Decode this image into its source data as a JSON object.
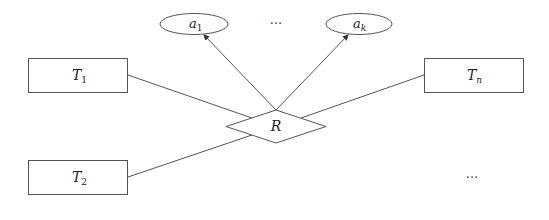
{
  "diagram": {
    "type": "er-diagram",
    "relationship": {
      "label": "R"
    },
    "entities": [
      {
        "id": "T1",
        "label": "T",
        "sub": "1"
      },
      {
        "id": "T2",
        "label": "T",
        "sub": "2"
      },
      {
        "id": "Tn",
        "label": "T",
        "sub": "n"
      }
    ],
    "attributes": [
      {
        "id": "a1",
        "label": "a",
        "sub": "1"
      },
      {
        "id": "ak",
        "label": "a",
        "sub": "k"
      }
    ],
    "ellipsis_attributes": "···",
    "ellipsis_entities": "···",
    "edges": [
      {
        "from": "T1",
        "to": "R",
        "arrow": false
      },
      {
        "from": "T2",
        "to": "R",
        "arrow": false
      },
      {
        "from": "Tn",
        "to": "R",
        "arrow": false
      },
      {
        "from": "R",
        "to": "a1",
        "arrow": true
      },
      {
        "from": "R",
        "to": "ak",
        "arrow": true
      }
    ],
    "colors": {
      "stroke": "#555555",
      "background": "#ffffff"
    }
  }
}
